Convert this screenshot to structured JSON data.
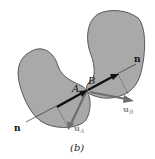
{
  "figure": {
    "caption": "(b)",
    "labels": {
      "point_a": "A",
      "point_b": "B",
      "normal_top": "n",
      "normal_bottom": "n",
      "velocity_a": "u",
      "velocity_a_sub": "A",
      "velocity_b": "u",
      "velocity_b_sub": "B"
    },
    "colors": {
      "body_fill": "#a9a9a9",
      "body_stroke": "#3a3a3a",
      "normal_line": "#333333",
      "normal_vector": "#111111",
      "velocity_vector": "#6e6e6e",
      "label_gray": "#8a8a8a"
    }
  }
}
